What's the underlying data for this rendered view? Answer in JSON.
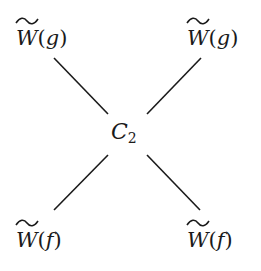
{
  "diagram": {
    "type": "cross / X-shaped relation diagram",
    "center": {
      "symbol": "C",
      "subscript": "2"
    },
    "nodes": [
      {
        "position": "top-left",
        "symbol": "W",
        "decoration": "tilde",
        "argument": "g",
        "open": "(",
        "close": ")"
      },
      {
        "position": "top-right",
        "symbol": "W",
        "decoration": "tilde",
        "argument": "g",
        "open": "(",
        "close": ")"
      },
      {
        "position": "bottom-left",
        "symbol": "W",
        "decoration": "tilde",
        "argument": "f",
        "open": "(",
        "close": ")"
      },
      {
        "position": "bottom-right",
        "symbol": "W",
        "decoration": "tilde",
        "argument": "f",
        "open": "(",
        "close": ")"
      }
    ],
    "edges": [
      {
        "from": "top-left",
        "to": "center"
      },
      {
        "from": "top-right",
        "to": "center"
      },
      {
        "from": "bottom-left",
        "to": "center"
      },
      {
        "from": "bottom-right",
        "to": "center"
      }
    ],
    "colors": {
      "line": "#1a1a1a",
      "text": "#1a1a1a",
      "background": "#ffffff"
    }
  }
}
